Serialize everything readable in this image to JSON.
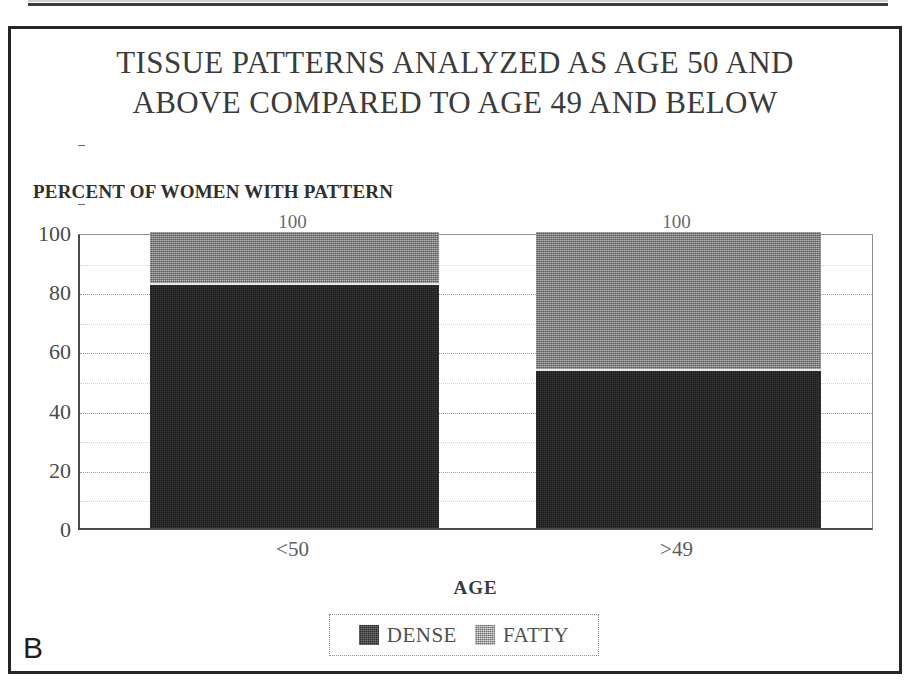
{
  "figure": {
    "panel_letter": "B",
    "title": "TISSUE PATTERNS ANALYZED AS AGE 50 AND\nABOVE COMPARED TO AGE 49 AND BELOW",
    "axis_note": "PERCENT OF WOMEN WITH PATTERN"
  },
  "chart_data": {
    "type": "bar",
    "title": "TISSUE PATTERNS ANALYZED AS AGE 50 AND ABOVE COMPARED TO AGE 49 AND BELOW",
    "subtitle": "PERCENT OF WOMEN WITH PATTERN",
    "stacked": true,
    "categories": [
      "<50",
      ">49"
    ],
    "series": [
      {
        "name": "DENSE",
        "values": [
          82,
          53
        ],
        "color": "#1d1d1d"
      },
      {
        "name": "FATTY",
        "values": [
          18,
          47
        ],
        "color": "#6e6e6e"
      }
    ],
    "totals": [
      100,
      100
    ],
    "bar_total_labels": [
      "100",
      "100"
    ],
    "xlabel": "AGE",
    "ylabel": "PERCENT OF WOMEN WITH PATTERN",
    "ylim": [
      0,
      100
    ],
    "yticks": [
      0,
      20,
      40,
      60,
      80,
      100
    ],
    "ytick_labels": [
      "0",
      "20",
      "40",
      "60",
      "80",
      "100"
    ],
    "minor_yticks": [
      10,
      30,
      50,
      70,
      90
    ],
    "grid": true,
    "legend_position": "bottom",
    "legend_entries": [
      "DENSE",
      "FATTY"
    ]
  }
}
